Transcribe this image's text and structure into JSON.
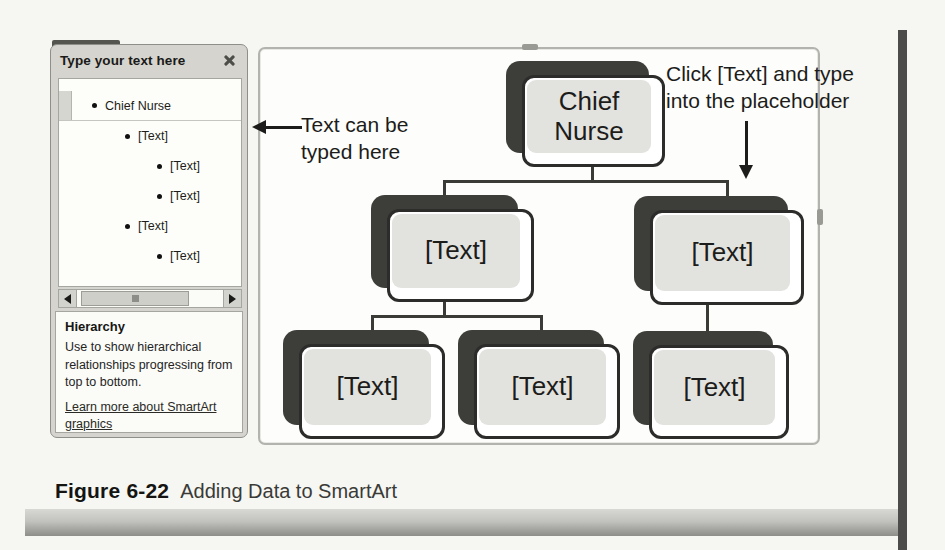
{
  "text_pane": {
    "title": "Type your text here",
    "items": [
      {
        "label": "Chief Nurse",
        "level": 1,
        "selected": true
      },
      {
        "label": "[Text]",
        "level": 2,
        "selected": false
      },
      {
        "label": "[Text]",
        "level": 3,
        "selected": false
      },
      {
        "label": "[Text]",
        "level": 3,
        "selected": false
      },
      {
        "label": "[Text]",
        "level": 2,
        "selected": false
      },
      {
        "label": "[Text]",
        "level": 3,
        "selected": false
      }
    ],
    "info": {
      "heading": "Hierarchy",
      "description": "Use to show hierarchical relationships progressing from top to bottom.",
      "link": "Learn more about SmartArt graphics"
    }
  },
  "diagram": {
    "layout": "hierarchy",
    "nodes": {
      "root": "Chief Nurse",
      "level2_left": "[Text]",
      "level2_right": "[Text]",
      "level3_left1": "[Text]",
      "level3_left2": "[Text]",
      "level3_right": "[Text]"
    }
  },
  "annotations": {
    "left_note": "Text can be typed here",
    "right_note": "Click [Text] and type into the placeholder"
  },
  "caption": {
    "label": "Figure 6-22",
    "text": "Adding Data to SmartArt"
  },
  "icons": {
    "close": "x-shape",
    "scroll_left": "left-triangle",
    "scroll_right": "right-triangle",
    "bullet": "filled-dot"
  },
  "colors": {
    "node_fill": "#e2e2de",
    "node_shadow": "#3d3d3a",
    "node_border": "#2c2c2a",
    "pane_bg": "#d5d4cf",
    "canvas_border": "#b2b2ae",
    "connector": "#3a3a37",
    "page_edge_bar": "#4c4c4a",
    "caption_bar_gradient_top": "#d8d8d5",
    "caption_bar_gradient_bottom": "#8d8d8a"
  }
}
